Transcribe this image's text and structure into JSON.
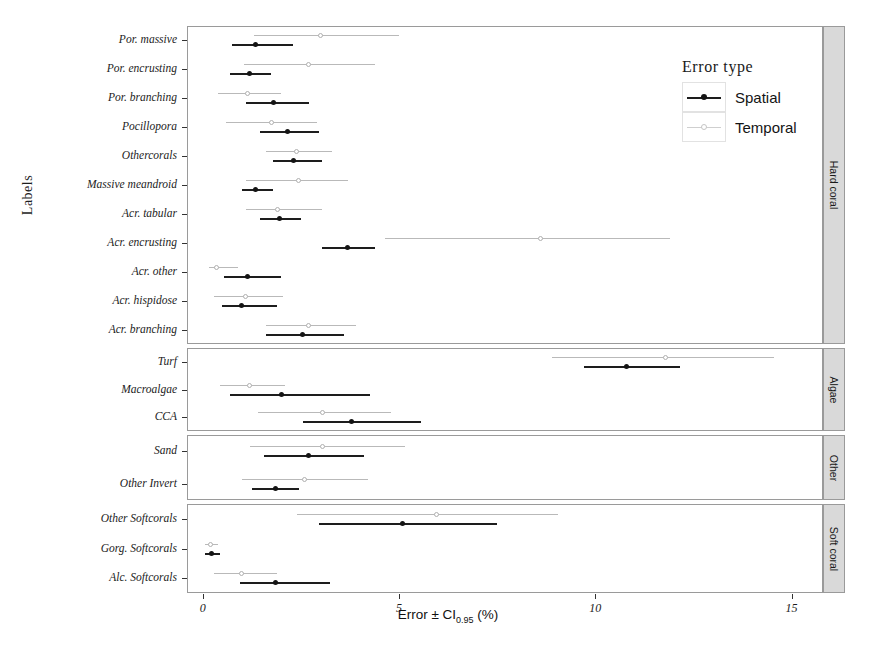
{
  "chart_data": {
    "type": "scatter",
    "title": "",
    "xlabel": "Error ± CI",
    "xlabel_sub": "0.95",
    "xlabel_unit": "(%)",
    "ylabel": "Labels",
    "xlim": [
      -0.4,
      15.8
    ],
    "xticks": [
      0,
      5,
      10,
      15
    ],
    "xticklabels": [
      "0",
      "5",
      "10",
      "15"
    ],
    "grid": false,
    "legend": {
      "title": "Error type",
      "position": "top-right",
      "entries": [
        {
          "name": "Spatial",
          "color": "#1d1d1d"
        },
        {
          "name": "Temporal",
          "color": "#bdbdbd"
        }
      ]
    },
    "panels": [
      {
        "name": "Hard coral",
        "categories": [
          "Por. massive",
          "Por. encrusting",
          "Por. branching",
          "Pocillopora",
          "Othercorals",
          "Massive meandroid",
          "Acr. tabular",
          "Acr. encrusting",
          "Acr. other",
          "Acr. hispidose",
          "Acr. branching"
        ],
        "series": [
          {
            "name": "Spatial",
            "points": [
              {
                "category": "Por. massive",
                "estimate": 1.35,
                "ci_low": 0.75,
                "ci_high": 2.3
              },
              {
                "category": "Por. encrusting",
                "estimate": 1.2,
                "ci_low": 0.7,
                "ci_high": 1.75
              },
              {
                "category": "Por. branching",
                "estimate": 1.8,
                "ci_low": 1.1,
                "ci_high": 2.7
              },
              {
                "category": "Pocillopora",
                "estimate": 2.15,
                "ci_low": 1.45,
                "ci_high": 2.95
              },
              {
                "category": "Othercorals",
                "estimate": 2.3,
                "ci_low": 1.8,
                "ci_high": 3.05
              },
              {
                "category": "Massive meandroid",
                "estimate": 1.35,
                "ci_low": 1.0,
                "ci_high": 1.8
              },
              {
                "category": "Acr. tabular",
                "estimate": 1.95,
                "ci_low": 1.45,
                "ci_high": 2.5
              },
              {
                "category": "Acr. encrusting",
                "estimate": 3.7,
                "ci_low": 3.05,
                "ci_high": 4.4
              },
              {
                "category": "Acr. other",
                "estimate": 1.15,
                "ci_low": 0.55,
                "ci_high": 2.0
              },
              {
                "category": "Acr. hispidose",
                "estimate": 1.0,
                "ci_low": 0.5,
                "ci_high": 1.9
              },
              {
                "category": "Acr. branching",
                "estimate": 2.55,
                "ci_low": 1.6,
                "ci_high": 3.6
              }
            ]
          },
          {
            "name": "Temporal",
            "points": [
              {
                "category": "Por. massive",
                "estimate": 3.0,
                "ci_low": 1.3,
                "ci_high": 5.0
              },
              {
                "category": "Por. encrusting",
                "estimate": 2.7,
                "ci_low": 1.05,
                "ci_high": 4.4
              },
              {
                "category": "Por. branching",
                "estimate": 1.15,
                "ci_low": 0.4,
                "ci_high": 2.0
              },
              {
                "category": "Pocillopora",
                "estimate": 1.75,
                "ci_low": 0.6,
                "ci_high": 2.9
              },
              {
                "category": "Othercorals",
                "estimate": 2.4,
                "ci_low": 1.6,
                "ci_high": 3.3
              },
              {
                "category": "Massive meandroid",
                "estimate": 2.45,
                "ci_low": 1.1,
                "ci_high": 3.7
              },
              {
                "category": "Acr. tabular",
                "estimate": 1.9,
                "ci_low": 1.1,
                "ci_high": 3.05
              },
              {
                "category": "Acr. encrusting",
                "estimate": 8.6,
                "ci_low": 4.65,
                "ci_high": 11.9
              },
              {
                "category": "Acr. other",
                "estimate": 0.35,
                "ci_low": 0.15,
                "ci_high": 0.9
              },
              {
                "category": "Acr. hispidose",
                "estimate": 1.1,
                "ci_low": 0.3,
                "ci_high": 2.05
              },
              {
                "category": "Acr. branching",
                "estimate": 2.7,
                "ci_low": 1.6,
                "ci_high": 3.9
              }
            ]
          }
        ]
      },
      {
        "name": "Algae",
        "categories": [
          "Turf",
          "Macroalgae",
          "CCA"
        ],
        "series": [
          {
            "name": "Spatial",
            "points": [
              {
                "category": "Turf",
                "estimate": 10.8,
                "ci_low": 9.7,
                "ci_high": 12.15
              },
              {
                "category": "Macroalgae",
                "estimate": 2.0,
                "ci_low": 0.7,
                "ci_high": 4.25
              },
              {
                "category": "CCA",
                "estimate": 3.8,
                "ci_low": 2.55,
                "ci_high": 5.55
              }
            ]
          },
          {
            "name": "Temporal",
            "points": [
              {
                "category": "Turf",
                "estimate": 11.8,
                "ci_low": 8.9,
                "ci_high": 14.55
              },
              {
                "category": "Macroalgae",
                "estimate": 1.2,
                "ci_low": 0.45,
                "ci_high": 2.1
              },
              {
                "category": "CCA",
                "estimate": 3.05,
                "ci_low": 1.4,
                "ci_high": 4.8
              }
            ]
          }
        ]
      },
      {
        "name": "Other",
        "categories": [
          "Sand",
          "Other Invert"
        ],
        "series": [
          {
            "name": "Spatial",
            "points": [
              {
                "category": "Sand",
                "estimate": 2.7,
                "ci_low": 1.55,
                "ci_high": 4.1
              },
              {
                "category": "Other Invert",
                "estimate": 1.85,
                "ci_low": 1.25,
                "ci_high": 2.45
              }
            ]
          },
          {
            "name": "Temporal",
            "points": [
              {
                "category": "Sand",
                "estimate": 3.05,
                "ci_low": 1.2,
                "ci_high": 5.15
              },
              {
                "category": "Other Invert",
                "estimate": 2.6,
                "ci_low": 1.0,
                "ci_high": 4.2
              }
            ]
          }
        ]
      },
      {
        "name": "Soft coral",
        "categories": [
          "Other Softcorals",
          "Gorg. Softcorals",
          "Alc. Softcorals"
        ],
        "series": [
          {
            "name": "Spatial",
            "points": [
              {
                "category": "Other Softcorals",
                "estimate": 5.1,
                "ci_low": 2.95,
                "ci_high": 7.5
              },
              {
                "category": "Gorg. Softcorals",
                "estimate": 0.22,
                "ci_low": 0.05,
                "ci_high": 0.45
              },
              {
                "category": "Alc. Softcorals",
                "estimate": 1.85,
                "ci_low": 0.95,
                "ci_high": 3.25
              }
            ]
          },
          {
            "name": "Temporal",
            "points": [
              {
                "category": "Other Softcorals",
                "estimate": 5.95,
                "ci_low": 2.4,
                "ci_high": 9.05
              },
              {
                "category": "Gorg. Softcorals",
                "estimate": 0.2,
                "ci_low": 0.05,
                "ci_high": 0.4
              },
              {
                "category": "Alc. Softcorals",
                "estimate": 1.0,
                "ci_low": 0.3,
                "ci_high": 1.9
              }
            ]
          }
        ]
      }
    ]
  }
}
